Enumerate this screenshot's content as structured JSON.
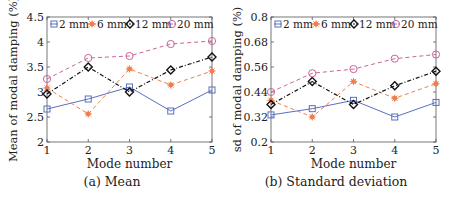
{
  "chart_data": [
    {
      "type": "line",
      "title": "",
      "caption": "(a) Mean",
      "xlabel": "Mode number",
      "ylabel": "Mean of modal damping (%)",
      "x": [
        1,
        2,
        3,
        4,
        5
      ],
      "xlim": [
        1,
        5
      ],
      "ylim": [
        2,
        4.5
      ],
      "xticks": [
        "1",
        "2",
        "3",
        "4",
        "5"
      ],
      "yticks": [
        "2",
        "2.5",
        "3",
        "3.5",
        "4",
        "4.5"
      ],
      "ytick_values": [
        2,
        2.5,
        3,
        3.5,
        4,
        4.5
      ],
      "grid": false,
      "legend_position": "top (inside, horizontal)",
      "series": [
        {
          "name": "2 mm",
          "values": [
            2.66,
            2.86,
            3.1,
            2.62,
            3.04
          ],
          "color": "#5a6fbf",
          "marker": "square",
          "line": "solid"
        },
        {
          "name": "6 mm",
          "values": [
            3.08,
            2.56,
            3.46,
            3.14,
            3.42
          ],
          "color": "#f07e4e",
          "marker": "asterisk",
          "line": "dashed"
        },
        {
          "name": "12 mm",
          "values": [
            2.96,
            3.5,
            3.0,
            3.44,
            3.7
          ],
          "color": "#111111",
          "marker": "diamond",
          "line": "dashdot"
        },
        {
          "name": "20 mm",
          "values": [
            3.26,
            3.68,
            3.72,
            3.96,
            4.02
          ],
          "color": "#c9649a",
          "marker": "circle",
          "line": "dashed"
        }
      ]
    },
    {
      "type": "line",
      "title": "",
      "caption": "(b) Standard deviation",
      "xlabel": "Mode number",
      "ylabel": "sd of modal damping (%)",
      "x": [
        1,
        2,
        3,
        4,
        5
      ],
      "xlim": [
        1,
        5
      ],
      "ylim": [
        0.2,
        0.8
      ],
      "xticks": [
        "1",
        "2",
        "3",
        "4",
        "5"
      ],
      "yticks": [
        "0.2",
        "0.32",
        "0.44",
        "0.56",
        "0.68",
        "0.8"
      ],
      "ytick_values": [
        0.2,
        0.32,
        0.44,
        0.56,
        0.68,
        0.8
      ],
      "grid": false,
      "legend_position": "top (inside, horizontal)",
      "series": [
        {
          "name": "2 mm",
          "values": [
            0.33,
            0.36,
            0.4,
            0.32,
            0.39
          ],
          "color": "#5a6fbf",
          "marker": "square",
          "line": "solid"
        },
        {
          "name": "6 mm",
          "values": [
            0.4,
            0.32,
            0.49,
            0.41,
            0.48
          ],
          "color": "#f07e4e",
          "marker": "asterisk",
          "line": "dashed"
        },
        {
          "name": "12 mm",
          "values": [
            0.38,
            0.49,
            0.38,
            0.47,
            0.54
          ],
          "color": "#111111",
          "marker": "diamond",
          "line": "dashdot"
        },
        {
          "name": "20 mm",
          "values": [
            0.44,
            0.53,
            0.55,
            0.6,
            0.62
          ],
          "color": "#c9649a",
          "marker": "circle",
          "line": "dashed"
        }
      ]
    }
  ]
}
